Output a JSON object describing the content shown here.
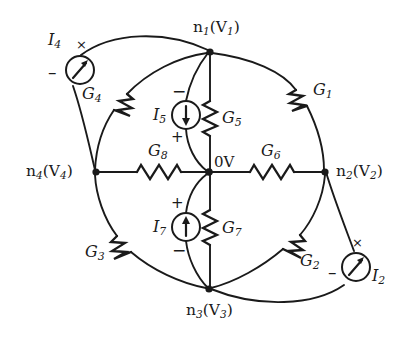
{
  "figure": {
    "type": "circuit-schematic",
    "title": "",
    "reference_node_label": "0V"
  },
  "nodes": [
    {
      "id": "n1",
      "label": "n",
      "sub": "1",
      "voltage": "V",
      "voltage_sub": "1",
      "text": "n1(V1)",
      "x": 210,
      "y": 52
    },
    {
      "id": "n2",
      "label": "n",
      "sub": "2",
      "voltage": "V",
      "voltage_sub": "2",
      "text": "n2(V2)",
      "x": 325,
      "y": 172
    },
    {
      "id": "n3",
      "label": "n",
      "sub": "3",
      "voltage": "V",
      "voltage_sub": "3",
      "text": "n3(V3)",
      "x": 209,
      "y": 289
    },
    {
      "id": "n4",
      "label": "n",
      "sub": "4",
      "voltage": "V",
      "voltage_sub": "4",
      "text": "n4(V4)",
      "x": 96,
      "y": 172
    },
    {
      "id": "ground",
      "label": "0V",
      "sub": "",
      "voltage": "",
      "voltage_sub": "",
      "text": "0V",
      "x": 209,
      "y": 172
    }
  ],
  "conductances": [
    {
      "id": "G1",
      "label": "G",
      "sub": "1",
      "text": "G1",
      "between": [
        "n1",
        "n2"
      ]
    },
    {
      "id": "G2",
      "label": "G",
      "sub": "2",
      "text": "G2",
      "between": [
        "n2",
        "n3"
      ]
    },
    {
      "id": "G3",
      "label": "G",
      "sub": "3",
      "text": "G3",
      "between": [
        "n4",
        "n3"
      ]
    },
    {
      "id": "G4",
      "label": "G",
      "sub": "4",
      "text": "G4",
      "between": [
        "n4",
        "n1"
      ]
    },
    {
      "id": "G5",
      "label": "G",
      "sub": "5",
      "text": "G5",
      "between": [
        "n1",
        "ground"
      ]
    },
    {
      "id": "G6",
      "label": "G",
      "sub": "6",
      "text": "G6",
      "between": [
        "ground",
        "n2"
      ]
    },
    {
      "id": "G7",
      "label": "G",
      "sub": "7",
      "text": "G7",
      "between": [
        "ground",
        "n3"
      ]
    },
    {
      "id": "G8",
      "label": "G",
      "sub": "8",
      "text": "G8",
      "between": [
        "n4",
        "ground"
      ]
    }
  ],
  "sources": [
    {
      "id": "I2",
      "label": "I",
      "sub": "2",
      "text": "I2",
      "plus_mark": "×",
      "minus_mark": "–",
      "direction": "diagonal-up",
      "between": [
        "n3",
        "n2"
      ]
    },
    {
      "id": "I4",
      "label": "I",
      "sub": "4",
      "text": "I4",
      "plus_mark": "×",
      "minus_mark": "–",
      "direction": "diagonal-up",
      "between": [
        "n4",
        "n1"
      ]
    },
    {
      "id": "I5",
      "label": "I",
      "sub": "5",
      "text": "I5",
      "plus_mark": "+",
      "minus_mark": "−",
      "direction": "down",
      "between": [
        "n1",
        "ground"
      ]
    },
    {
      "id": "I7",
      "label": "I",
      "sub": "7",
      "text": "I7",
      "plus_mark": "+",
      "minus_mark": "−",
      "direction": "up",
      "between": [
        "ground",
        "n3"
      ]
    }
  ],
  "colors": {
    "ink": "#1a1a1a",
    "background": "#ffffff"
  }
}
